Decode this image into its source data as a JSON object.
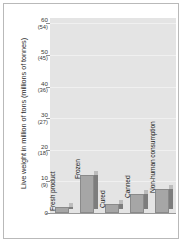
{
  "chart_data": {
    "type": "bar",
    "title": "",
    "xlabel": "",
    "ylabel": "Live weight in million of tons (millions of tonnes)",
    "categories": [
      "Fresh product",
      "Frozen",
      "Cured",
      "Canned",
      "Non-human consumption"
    ],
    "values": [
      2,
      12,
      3,
      6,
      7.5
    ],
    "ylim": [
      0,
      62
    ],
    "grid": true,
    "legend": "none",
    "y_ticks": [
      {
        "main": "60",
        "alt": "(54)",
        "value": 60
      },
      {
        "main": "50",
        "alt": "(45)",
        "value": 50
      },
      {
        "main": "40",
        "alt": "(36)",
        "value": 40
      },
      {
        "main": "30",
        "alt": "(27)",
        "value": 30
      },
      {
        "main": "20",
        "alt": "(18)",
        "value": 20
      },
      {
        "main": "10",
        "alt": "(9)",
        "value": 10
      },
      {
        "main": "0",
        "alt": "",
        "value": 0
      }
    ],
    "secondary_axis_note": "values in parentheses are the metric-tonne equivalents (primary x 0.9)",
    "colors": {
      "plot_background": "#e4e4e4",
      "bar_front": "#a6a6a6",
      "bar_side": "#7d7d7d",
      "bar_top": "#bcbcbc",
      "gridline": "#f0f0f0",
      "axis": "#9a9a9a",
      "frame": "#b9b9b9",
      "text": "#2a2a2a"
    }
  }
}
